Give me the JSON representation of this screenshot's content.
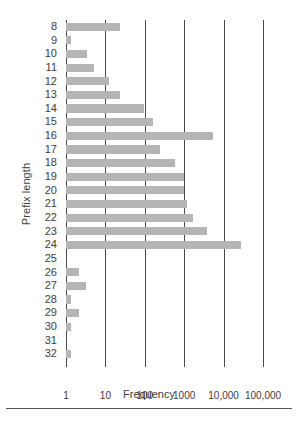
{
  "chart_data": {
    "type": "bar",
    "orientation": "horizontal",
    "title": "",
    "xlabel": "Frequency",
    "ylabel": "Prefix length",
    "xscale": "log",
    "xlim": [
      1,
      300000
    ],
    "grid": true,
    "legend": false,
    "bar_color": "#b5b5b5",
    "axis_color": "#4a4a4a",
    "xticks": [
      1,
      10,
      100,
      1000,
      10000,
      100000
    ],
    "xtick_labels": [
      "1",
      "10",
      "100",
      "1000",
      "10,000",
      "100,000"
    ],
    "categories": [
      "8",
      "9",
      "10",
      "11",
      "12",
      "13",
      "14",
      "15",
      "16",
      "17",
      "18",
      "19",
      "20",
      "21",
      "22",
      "23",
      "24",
      "25",
      "26",
      "27",
      "28",
      "29",
      "30",
      "31",
      "32"
    ],
    "values": [
      24,
      1.3,
      3.5,
      5,
      12,
      23,
      95,
      160,
      5500,
      250,
      600,
      1000,
      1000,
      1150,
      1700,
      3700,
      28000,
      0,
      2.2,
      3.3,
      1.3,
      2.2,
      1.3,
      0,
      1.3
    ],
    "series": [
      {
        "name": "Frequency",
        "points": [
          {
            "category": "8",
            "value": 24
          },
          {
            "category": "9",
            "value": 1.3
          },
          {
            "category": "10",
            "value": 3.5
          },
          {
            "category": "11",
            "value": 5
          },
          {
            "category": "12",
            "value": 12
          },
          {
            "category": "13",
            "value": 23
          },
          {
            "category": "14",
            "value": 95
          },
          {
            "category": "15",
            "value": 160
          },
          {
            "category": "16",
            "value": 5500
          },
          {
            "category": "17",
            "value": 250
          },
          {
            "category": "18",
            "value": 600
          },
          {
            "category": "19",
            "value": 1000
          },
          {
            "category": "20",
            "value": 1000
          },
          {
            "category": "21",
            "value": 1150
          },
          {
            "category": "22",
            "value": 1700
          },
          {
            "category": "23",
            "value": 3700
          },
          {
            "category": "24",
            "value": 28000
          },
          {
            "category": "25",
            "value": 0
          },
          {
            "category": "26",
            "value": 2.2
          },
          {
            "category": "27",
            "value": 3.3
          },
          {
            "category": "28",
            "value": 1.3
          },
          {
            "category": "29",
            "value": 2.2
          },
          {
            "category": "30",
            "value": 1.3
          },
          {
            "category": "31",
            "value": 0
          },
          {
            "category": "32",
            "value": 1.3
          }
        ]
      }
    ]
  }
}
